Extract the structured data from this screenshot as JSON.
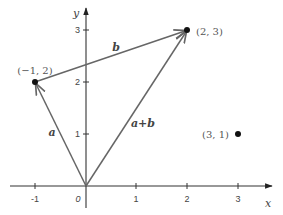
{
  "figure": {
    "kind": "vector-addition-diagram",
    "axes": {
      "x_label": "x",
      "y_label": "y",
      "origin_label": "0",
      "x_ticks": [
        {
          "value": -1,
          "label": "-1"
        },
        {
          "value": 1,
          "label": "1"
        },
        {
          "value": 2,
          "label": "2"
        },
        {
          "value": 3,
          "label": "3"
        }
      ],
      "y_ticks": [
        {
          "value": 1,
          "label": "1"
        },
        {
          "value": 2,
          "label": "2"
        },
        {
          "value": 3,
          "label": "3"
        }
      ]
    },
    "points": [
      {
        "id": "p1",
        "x": -1,
        "y": 2,
        "label": "(−1, 2)"
      },
      {
        "id": "p2",
        "x": 2,
        "y": 3,
        "label": "(2, 3)"
      },
      {
        "id": "p3",
        "x": 3,
        "y": 1,
        "label": "(3, 1)"
      }
    ],
    "vectors": [
      {
        "id": "a",
        "label": "a",
        "from": [
          0,
          0
        ],
        "to": [
          -1,
          2
        ]
      },
      {
        "id": "b",
        "label": "b",
        "from": [
          -1,
          2
        ],
        "to": [
          2,
          3
        ]
      },
      {
        "id": "apb",
        "label": "a+b",
        "from": [
          0,
          0
        ],
        "to": [
          2,
          3
        ]
      }
    ],
    "colors": {
      "axis": "#333333",
      "vector": "#666666",
      "point": "#111111",
      "text": "#444444"
    }
  }
}
